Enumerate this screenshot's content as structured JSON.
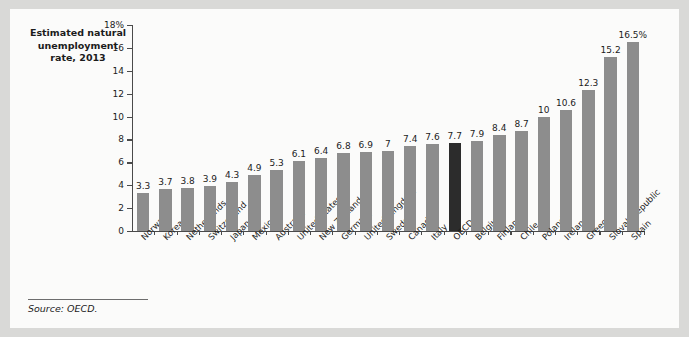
{
  "figure": {
    "title": "Estimated natural\nunemployment\nrate, 2013",
    "source": "Source: OECD.",
    "bar_color": "#8d8d8d",
    "highlight_color": "#2c2c2c",
    "axis_color": "#4a4a4a",
    "panel_color": "#fbfbfa",
    "page_color": "#d9d9d7"
  },
  "chart_data": {
    "type": "bar",
    "title": "Estimated natural unemployment rate, 2013",
    "xlabel": "",
    "ylabel": "",
    "ylim": [
      0,
      18
    ],
    "ytick_values": [
      0,
      2,
      4,
      6,
      8,
      10,
      12,
      14,
      16,
      18
    ],
    "ytick_labels": [
      "0",
      "2",
      "4",
      "6",
      "8",
      "10",
      "12",
      "14",
      "16",
      "18%"
    ],
    "grid": false,
    "legend": null,
    "highlight_category": "OECD",
    "categories": [
      "Norway",
      "Korea",
      "Netherlands",
      "Switzerland",
      "Japan",
      "Mexico",
      "Australia",
      "United States",
      "New Zealand",
      "Germany",
      "United Kingdom",
      "Sweden",
      "Canada",
      "Italy",
      "OECD",
      "Belgium",
      "Finland",
      "Chile",
      "Poland",
      "Ireland",
      "Greece",
      "Slovak Republic",
      "Spain"
    ],
    "values": [
      3.3,
      3.7,
      3.8,
      3.9,
      4.3,
      4.9,
      5.3,
      6.1,
      6.4,
      6.8,
      6.9,
      7,
      7.4,
      7.6,
      7.7,
      7.9,
      8.4,
      8.7,
      10,
      10.6,
      12.3,
      15.2,
      16.5
    ],
    "value_labels": [
      "3.3",
      "3.7",
      "3.8",
      "3.9",
      "4.3",
      "4.9",
      "5.3",
      "6.1",
      "6.4",
      "6.8",
      "6.9",
      "7",
      "7.4",
      "7.6",
      "7.7",
      "7.9",
      "8.4",
      "8.7",
      "10",
      "10.6",
      "12.3",
      "15.2",
      "16.5%"
    ]
  }
}
